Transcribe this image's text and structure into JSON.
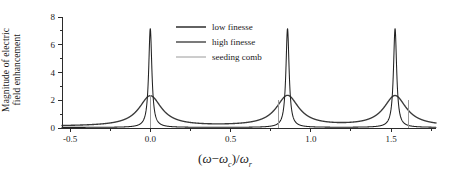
{
  "chart_data": {
    "type": "line",
    "title": "",
    "xlabel": "(ω−ωc)/ωr",
    "ylabel": "Magnitude of electric field enhancement",
    "ylabel_line1": "Magnitude of electric",
    "ylabel_line2": "field enhancement",
    "xlim": [
      -0.55,
      1.78
    ],
    "ylim": [
      0,
      8
    ],
    "xticks": [
      -0.5,
      0.0,
      0.5,
      1.0,
      1.5
    ],
    "xticklabels": [
      "-0.5",
      "0.0",
      "0.5",
      "1.0",
      "1.5"
    ],
    "xminorticks": [
      -0.25,
      0.25,
      0.75,
      1.25,
      1.75
    ],
    "yticks": [
      0,
      2,
      4,
      6,
      8
    ],
    "yticklabels": [
      "0",
      "2",
      "4",
      "6",
      "8"
    ],
    "grid": false,
    "legend_position": "top-center",
    "series": [
      {
        "name": "low finesse",
        "color": "#3a3a3a",
        "lineshape": "lorentzian",
        "peak_height": 2.3,
        "hwhm": 0.085,
        "baseline": 0.12,
        "peak_positions": [
          0.0,
          0.855,
          1.525
        ]
      },
      {
        "name": "high finesse",
        "color": "#222222",
        "lineshape": "lorentzian",
        "peak_height": 7.15,
        "hwhm": 0.012,
        "baseline": 0.04,
        "peak_positions": [
          0.0,
          0.855,
          1.525
        ]
      },
      {
        "name": "seeding comb",
        "color": "#9a9a9a",
        "lineshape": "vertical-lines",
        "lines": [
          {
            "x": 0.0,
            "height": 2.35
          },
          {
            "x": 0.8,
            "height": 2.05
          },
          {
            "x": 1.61,
            "height": 2.0
          }
        ]
      }
    ]
  },
  "legend": {
    "items": [
      {
        "label": "low finesse"
      },
      {
        "label": "high finesse"
      },
      {
        "label": "seeding comb"
      }
    ]
  },
  "axis_label_parts": {
    "open_paren": "(",
    "omega": "ω",
    "minus": "−",
    "omega_c": "ω",
    "sub_c": "c",
    "close_paren": ")",
    "slash": "/",
    "omega_r": "ω",
    "sub_r": "r"
  }
}
